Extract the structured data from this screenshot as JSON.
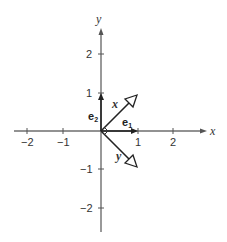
{
  "diagram": {
    "axes": {
      "x_label": "x",
      "y_label": "y",
      "x_ticks": [
        "−2",
        "−1",
        "1",
        "2"
      ],
      "y_ticks": [
        "2",
        "1",
        "−1",
        "−2"
      ]
    },
    "basis_vectors": [
      {
        "name": "e",
        "sub": "1",
        "direction": [
          1,
          0
        ]
      },
      {
        "name": "e",
        "sub": "2",
        "direction": [
          0,
          1
        ]
      }
    ],
    "vectors": [
      {
        "label": "x",
        "direction": [
          0.707,
          0.707
        ]
      },
      {
        "label": "y",
        "direction": [
          0.707,
          -0.707
        ]
      }
    ],
    "right_angle_marker": true
  }
}
